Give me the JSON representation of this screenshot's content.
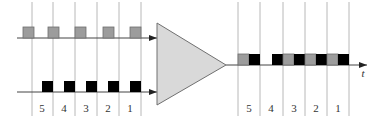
{
  "diagram": {
    "type": "time-division multiplexer",
    "colors": {
      "gray_block": "#9c9c9c",
      "gray_block_border": "#6e6e6e",
      "black_block": "#000000",
      "mux_fill": "#d9d9d9",
      "mux_stroke": "#707070",
      "line": "#555555",
      "grid_line": "#b8b8b8"
    },
    "inputs": [
      {
        "name": "input-gray",
        "block_color": "gray",
        "y": 38
      },
      {
        "name": "input-black",
        "block_color": "black",
        "y": 92
      }
    ],
    "input_slots": {
      "labels": [
        "5",
        "4",
        "3",
        "2",
        "1"
      ],
      "grid_x": [
        32,
        53,
        75,
        97,
        119,
        141
      ]
    },
    "output_slots": {
      "labels": [
        "5",
        "4",
        "3",
        "2",
        "1"
      ],
      "grid_x": [
        238,
        260,
        283,
        305,
        327,
        349
      ]
    },
    "output_sequence": [
      {
        "slot": "5",
        "blocks": [
          "gray",
          "black"
        ]
      },
      {
        "slot": "4",
        "blocks": [
          "empty",
          "black"
        ]
      },
      {
        "slot": "3",
        "blocks": [
          "gray",
          "black"
        ]
      },
      {
        "slot": "2",
        "blocks": [
          "gray",
          "black"
        ]
      },
      {
        "slot": "1",
        "blocks": [
          "gray",
          "black"
        ]
      }
    ],
    "time_axis_label": "t"
  }
}
